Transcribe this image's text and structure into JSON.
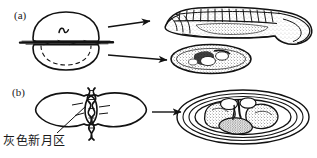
{
  "figure": {
    "type": "biology-diagram",
    "panels": [
      {
        "id": "a",
        "label": "(a)",
        "ligature": "hair-loop-through-gray-crescent-plane",
        "outcomes": [
          {
            "name": "normal-larva",
            "description": "segmented tadpole larva"
          },
          {
            "name": "belly-piece",
            "description": "undifferentiated stippled oval mass"
          }
        ],
        "arrows": 2
      },
      {
        "id": "b",
        "label": "(b)",
        "ligature": "twisted-hair-loop-perpendicular",
        "outcomes": [
          {
            "name": "cleaving-egg",
            "description": "egg with blastomeres inside concentric jelly coats"
          }
        ],
        "arrows": 1
      }
    ],
    "annotations": {
      "gray_crescent": "灰色新月区"
    },
    "colors": {
      "ink": "#121212",
      "background": "#ffffff"
    }
  }
}
